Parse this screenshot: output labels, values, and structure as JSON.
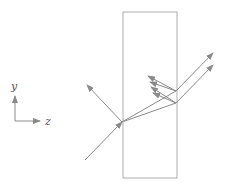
{
  "diagram": {
    "axes": {
      "y_label": "y",
      "z_label": "z"
    },
    "colors": {
      "line": "#8a8a8a",
      "slab": "#999999",
      "text": "#555555"
    }
  }
}
